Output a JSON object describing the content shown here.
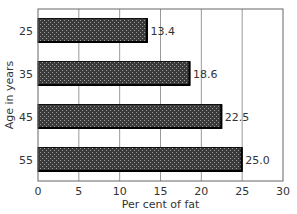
{
  "chart_data": {
    "type": "bar",
    "orientation": "horizontal",
    "title": "",
    "categories": [
      "25",
      "35",
      "45",
      "55"
    ],
    "values": [
      13.4,
      18.6,
      22.5,
      25.0
    ],
    "data_labels": [
      "13.4",
      "18.6",
      "22.5",
      "25.0"
    ],
    "xlabel": "Per cent of fat",
    "ylabel": "Age in years",
    "xlim": [
      0,
      30
    ],
    "xticks": [
      0,
      5,
      10,
      15,
      20,
      25,
      30
    ],
    "xtick_labels": [
      "0",
      "5",
      "10",
      "15",
      "20",
      "25",
      "30"
    ],
    "grid": true,
    "legend": "none",
    "bar_color": "#4a4a4a",
    "bar_pattern": "crosshatch"
  }
}
